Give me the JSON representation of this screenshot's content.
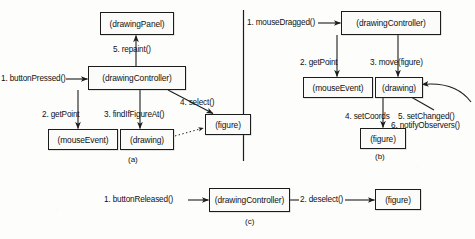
{
  "figure": {
    "caption_a": "(a)",
    "caption_b": "(b)",
    "caption_c": "(c)",
    "ink_color": "#1c1c1c",
    "paper_color": "#fdfdfc"
  },
  "panel_a": {
    "objects": {
      "drawing_panel": "(drawingPanel)",
      "drawing_controller": "(drawingController)",
      "mouse_event": "(mouseEvent)",
      "drawing": "(drawing)",
      "figure": "(figure)"
    },
    "messages": {
      "m1": "1. buttonPressed()",
      "m2": "2. getPoint",
      "m3": "3. findIfFigureAt()",
      "m4": "4. select()",
      "m5": "5. repaint()"
    }
  },
  "panel_b": {
    "objects": {
      "drawing_controller": "(drawingController)",
      "mouse_event": "(mouseEvent)",
      "drawing": "(drawing)",
      "figure": "(figure)"
    },
    "messages": {
      "m1": "1. mouseDragged()",
      "m2": "2. getPoint",
      "m3": "3. move(figure)",
      "m4": "4. setCoords",
      "m5": "5. setChanged()",
      "m6": "6. notifyObservers()"
    }
  },
  "panel_c": {
    "objects": {
      "drawing_controller": "(drawingController)",
      "figure": "(figure)"
    },
    "messages": {
      "m1": "1. buttonReleased()",
      "m2": "2. deselect()"
    }
  }
}
